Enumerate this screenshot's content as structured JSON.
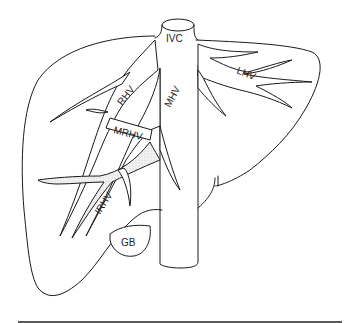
{
  "diagram": {
    "labels": {
      "ivc": "IVC",
      "lhv": "LHV",
      "rhv": "RHV",
      "mhv": "MHV",
      "mrhv": "MRHV",
      "irhv": "IRHV",
      "gb": "GB"
    },
    "colors": {
      "line": "#1a1a1a",
      "background": "#ffffff",
      "stipple": "#d9d9d9"
    }
  }
}
